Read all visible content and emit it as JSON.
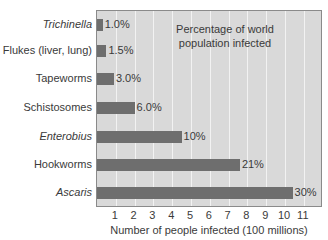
{
  "chart_data": {
    "type": "bar",
    "orientation": "horizontal",
    "title": "",
    "annotation": "Percentage of world population infected",
    "xlabel": "Number of people infected (100 millions)",
    "ylabel": "",
    "xlim": [
      0,
      12
    ],
    "xticks": [
      1,
      2,
      3,
      4,
      5,
      6,
      7,
      8,
      9,
      10,
      11
    ],
    "grid": true,
    "categories": [
      "Trichinella",
      "Flukes (liver, lung)",
      "Tapeworms",
      "Schistosomes",
      "Enterobius",
      "Hookworms",
      "Ascaris"
    ],
    "italic_categories": [
      "Trichinella",
      "Enterobius",
      "Ascaris"
    ],
    "values": [
      0.3,
      0.5,
      0.9,
      2.0,
      4.5,
      7.6,
      10.4
    ],
    "percent_labels": [
      "1.0%",
      "1.5%",
      "3.0%",
      "6.0%",
      "10%",
      "21%",
      "30%"
    ]
  },
  "colors": {
    "bar": "#6e6e6e",
    "plot_background": "#d9d9d9",
    "gridline": "#f2f2f2",
    "text": "#3a3a3a"
  }
}
